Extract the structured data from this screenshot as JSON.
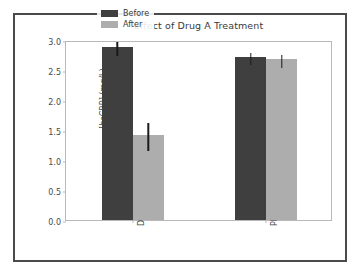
{
  "chart_data": {
    "type": "bar",
    "title": "Effect of Drug A Treatment",
    "xlabel": "",
    "ylabel": "[hsCRP] (mg/L)",
    "categories": [
      "Drug",
      "Placebo"
    ],
    "series": [
      {
        "name": "Before",
        "color": "#3f3f3f",
        "values": [
          2.88,
          2.72
        ],
        "errors": [
          0.12,
          0.1
        ]
      },
      {
        "name": "After",
        "color": "#adadad",
        "values": [
          1.42,
          2.68
        ],
        "errors": [
          0.23,
          0.11
        ]
      }
    ],
    "ylim": [
      0.0,
      3.0
    ],
    "yticks": [
      "0.0",
      "0.5",
      "1.0",
      "1.5",
      "2.0",
      "2.5",
      "3.0"
    ],
    "ytick_values": [
      0.0,
      0.5,
      1.0,
      1.5,
      2.0,
      2.5,
      3.0
    ],
    "grid": false,
    "legend_position": "upper center",
    "error_bar_color": "#1a1a1a",
    "frame_color": "#4a4a4a",
    "axes_color": "#b8b8b8",
    "background": "#ffffff"
  }
}
